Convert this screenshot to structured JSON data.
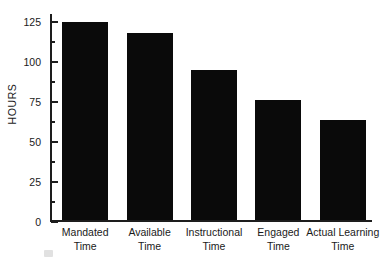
{
  "chart_data": {
    "type": "bar",
    "title": "",
    "xlabel": "",
    "ylabel": "HOURS",
    "categories": [
      "Mandated Time",
      "Available Time",
      "Instructional Time",
      "Engaged Time",
      "Actual Learning Time"
    ],
    "category_lines": [
      [
        "Mandated",
        "Time"
      ],
      [
        "Available",
        "Time"
      ],
      [
        "Instructional",
        "Time"
      ],
      [
        "Engaged",
        "Time"
      ],
      [
        "Actual Learning",
        "Time"
      ]
    ],
    "values": [
      125,
      118,
      95,
      76,
      63
    ],
    "ylim": [
      0,
      130
    ],
    "yticks": [
      0,
      25,
      50,
      75,
      100,
      125
    ],
    "ytick_labels": [
      "0",
      "25",
      "50",
      "75",
      "100",
      "125"
    ],
    "minor_ticks": [
      12.5,
      37.5,
      62.5,
      87.5,
      112.5
    ],
    "grid": false,
    "legend": null,
    "bar_color": "#0a0a0a",
    "axis_color": "#1d1d1d",
    "background": "#ffffff"
  }
}
